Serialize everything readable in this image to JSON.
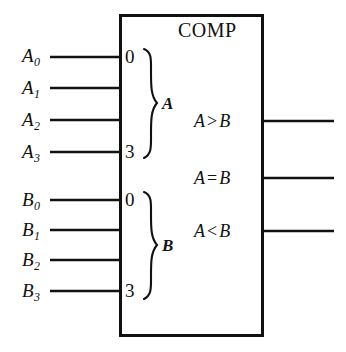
{
  "diagram": {
    "title": "COMP",
    "block_label": "COMP",
    "line_color": "#111111",
    "background_color": "#ffffff",
    "inputs_a": [
      {
        "name": "A0",
        "base": "A",
        "sub": "0",
        "pin_index": "0"
      },
      {
        "name": "A1",
        "base": "A",
        "sub": "1",
        "pin_index": ""
      },
      {
        "name": "A2",
        "base": "A",
        "sub": "2",
        "pin_index": ""
      },
      {
        "name": "A3",
        "base": "A",
        "sub": "3",
        "pin_index": "3"
      }
    ],
    "inputs_b": [
      {
        "name": "B0",
        "base": "B",
        "sub": "0",
        "pin_index": "0"
      },
      {
        "name": "B1",
        "base": "B",
        "sub": "1",
        "pin_index": ""
      },
      {
        "name": "B2",
        "base": "B",
        "sub": "2",
        "pin_index": ""
      },
      {
        "name": "B3",
        "base": "B",
        "sub": "3",
        "pin_index": "3"
      }
    ],
    "group_labels": {
      "a": "A",
      "b": "B"
    },
    "pin_indices": {
      "a_top": "0",
      "a_bottom": "3",
      "b_top": "0",
      "b_bottom": "3"
    },
    "outputs": [
      {
        "name": "A-greater-B",
        "left": "A",
        "op": ">",
        "right": "B"
      },
      {
        "name": "A-equal-B",
        "left": "A",
        "op": "=",
        "right": "B"
      },
      {
        "name": "A-less-B",
        "left": "A",
        "op": "<",
        "right": "B"
      }
    ]
  }
}
